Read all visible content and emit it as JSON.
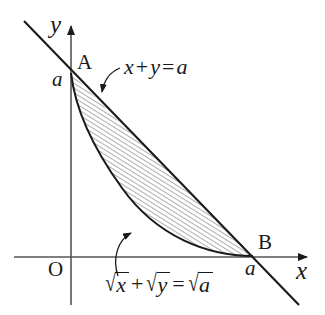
{
  "figure": {
    "kind": "math-diagram",
    "background_color": "#ffffff",
    "stroke_color": "#1a1a1a",
    "axes": {
      "x_label": "x",
      "y_label": "y",
      "origin_label": "O"
    },
    "points": [
      {
        "name": "A",
        "label": "A",
        "tick_label": "a",
        "on_axis": "y"
      },
      {
        "name": "B",
        "label": "B",
        "tick_label": "a",
        "on_axis": "x"
      }
    ],
    "curves": [
      {
        "id": "line",
        "label_text": "x+y=a",
        "label_parts": {
          "x": "x",
          "plus": "+",
          "y": "y",
          "equals": "=",
          "a": "a"
        },
        "type": "straight-line",
        "description": "line through A(0,a) and B(a,0)"
      },
      {
        "id": "parabola-arc",
        "label_text": "√x + √y = √a",
        "label_parts": {
          "radical": "√",
          "x": "x",
          "plus": "+",
          "y": "y",
          "equals": "=",
          "a": "a"
        },
        "type": "parabolic-arc",
        "description": "arc of sqrt(x)+sqrt(y)=sqrt(a) from A to B, tangent to both axes"
      }
    ],
    "shaded_region": {
      "fill_style": "diagonal-hatching",
      "between": [
        "line",
        "parabola-arc"
      ]
    }
  }
}
